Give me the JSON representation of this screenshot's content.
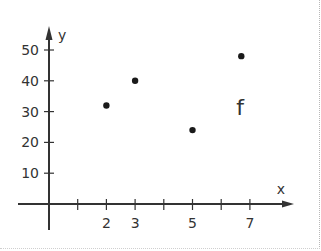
{
  "chart_data": {
    "type": "scatter",
    "title": "",
    "xlabel": "x",
    "ylabel": "y",
    "function_label": "f",
    "xlim": [
      0,
      8
    ],
    "ylim": [
      0,
      55
    ],
    "x_ticks": [
      1,
      2,
      3,
      4,
      5,
      6,
      7
    ],
    "x_tick_labels": [
      "",
      "2",
      "3",
      "",
      "5",
      "",
      "7"
    ],
    "y_ticks": [
      10,
      20,
      30,
      40,
      50
    ],
    "y_tick_labels": [
      "10",
      "20",
      "30",
      "40",
      "50"
    ],
    "grid": false,
    "legend": null,
    "points": [
      {
        "x": 2,
        "y": 32
      },
      {
        "x": 3,
        "y": 40
      },
      {
        "x": 5,
        "y": 24
      },
      {
        "x": 6.7,
        "y": 48
      }
    ],
    "colors": {
      "axis": "#333333",
      "point": "#1a1a1a",
      "text": "#333333"
    }
  }
}
